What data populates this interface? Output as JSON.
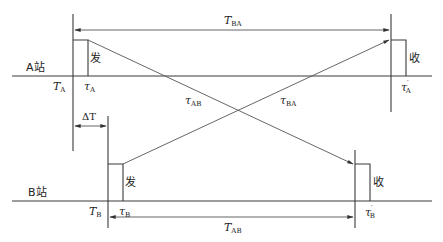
{
  "diagram": {
    "type": "two-way time transfer timing diagram",
    "stations": [
      {
        "id": "A",
        "label": "A站",
        "time_symbol": "T",
        "time_sub": "A",
        "send_tau": "τ",
        "send_tau_sub": "A",
        "recv_tau": "τ",
        "recv_tau_sub": "A",
        "recv_tau_prime": "′"
      },
      {
        "id": "B",
        "label": "B站",
        "time_symbol": "T",
        "time_sub": "B",
        "send_tau": "τ",
        "send_tau_sub": "B",
        "recv_tau": "τ",
        "recv_tau_sub": "B",
        "recv_tau_prime": "′"
      }
    ],
    "pulse_labels": {
      "send": "发",
      "receive": "收"
    },
    "intervals": {
      "t_ba": {
        "symbol": "T",
        "sub": "BA"
      },
      "t_ab": {
        "symbol": "T",
        "sub": "AB"
      },
      "delta_t": "ΔT"
    },
    "paths": {
      "tau_ab": {
        "symbol": "τ",
        "sub": "AB"
      },
      "tau_ba": {
        "symbol": "τ",
        "sub": "BA"
      }
    }
  }
}
